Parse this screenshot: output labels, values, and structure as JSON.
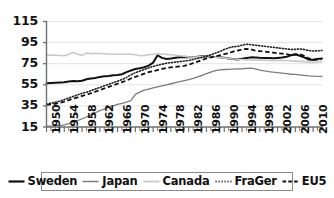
{
  "chart_data": {
    "type": "line",
    "title": "",
    "xlabel": "",
    "ylabel": "",
    "xlim": [
      1950,
      2012
    ],
    "ylim": [
      15,
      115
    ],
    "grid": true,
    "grid_axis": "y",
    "legend_position": "bottom",
    "yticks": [
      15,
      35,
      55,
      75,
      95,
      115
    ],
    "xticks": [
      1950,
      1954,
      1958,
      1962,
      1966,
      1970,
      1974,
      1978,
      1982,
      1986,
      1990,
      1994,
      1998,
      2002,
      2006,
      2010
    ],
    "x_minor_tick_interval": 1,
    "x": [
      1950,
      1951,
      1952,
      1953,
      1954,
      1955,
      1956,
      1957,
      1958,
      1959,
      1960,
      1961,
      1962,
      1963,
      1964,
      1965,
      1966,
      1967,
      1968,
      1969,
      1970,
      1971,
      1972,
      1973,
      1974,
      1975,
      1976,
      1977,
      1978,
      1979,
      1980,
      1981,
      1982,
      1983,
      1984,
      1985,
      1986,
      1987,
      1988,
      1989,
      1990,
      1991,
      1992,
      1993,
      1994,
      1995,
      1996,
      1997,
      1998,
      1999,
      2000,
      2001,
      2002,
      2003,
      2004,
      2005,
      2006,
      2007,
      2008,
      2009,
      2010,
      2011,
      2012
    ],
    "series": [
      {
        "name": "Sweden",
        "style": "solid",
        "color": "#111111",
        "width": 2.0,
        "values": [
          56.5,
          56.8,
          57.0,
          57.2,
          57.4,
          58.2,
          58.6,
          58.4,
          58.8,
          60.2,
          61.0,
          61.4,
          62.5,
          63.0,
          63.4,
          64.0,
          64.2,
          65.0,
          67.0,
          68.6,
          70.0,
          70.6,
          71.6,
          73.2,
          76.0,
          83.0,
          80.5,
          79.5,
          80.0,
          80.6,
          81.0,
          81.2,
          81.4,
          81.0,
          81.5,
          82.0,
          81.8,
          81.6,
          81.4,
          81.0,
          80.6,
          80.0,
          79.4,
          79.0,
          79.8,
          80.4,
          81.0,
          80.8,
          80.6,
          80.5,
          80.4,
          80.2,
          80.5,
          80.8,
          81.5,
          83.0,
          84.0,
          82.5,
          81.0,
          79.0,
          78.6,
          79.5,
          80.0
        ]
      },
      {
        "name": "Japan",
        "style": "solid",
        "color": "#7c7c7c",
        "width": 1.3,
        "values": [
          15.5,
          15.8,
          16.0,
          16.4,
          17.0,
          18.2,
          19.5,
          21.0,
          22.8,
          24.5,
          26.5,
          28.5,
          30.5,
          32.0,
          33.5,
          35.0,
          36.5,
          37.5,
          38.5,
          40.0,
          46.0,
          48.0,
          50.0,
          51.0,
          52.0,
          53.0,
          54.0,
          55.0,
          56.0,
          57.0,
          58.0,
          59.0,
          60.0,
          61.0,
          62.5,
          64.0,
          65.6,
          67.0,
          68.5,
          69.2,
          69.5,
          69.6,
          69.8,
          70.0,
          70.2,
          70.5,
          70.8,
          70.0,
          69.0,
          68.2,
          67.5,
          67.0,
          66.6,
          66.0,
          65.5,
          65.0,
          64.8,
          64.5,
          64.0,
          63.5,
          63.2,
          63.0,
          63.0
        ]
      },
      {
        "name": "Canada",
        "style": "solid",
        "color": "#c8c8c8",
        "width": 1.6,
        "values": [
          83.0,
          83.2,
          83.0,
          82.8,
          82.5,
          84.0,
          85.5,
          84.0,
          83.0,
          85.0,
          84.5,
          84.8,
          84.6,
          84.5,
          84.2,
          84.0,
          84.0,
          84.0,
          84.0,
          84.0,
          83.5,
          82.5,
          82.8,
          83.6,
          84.0,
          84.5,
          84.2,
          83.8,
          83.5,
          83.0,
          82.5,
          82.2,
          81.5,
          81.0,
          81.5,
          81.8,
          81.5,
          81.4,
          81.2,
          81.0,
          80.5,
          80.0,
          79.5,
          79.2,
          79.0,
          78.6,
          78.5,
          78.5,
          78.4,
          78.2,
          78.0,
          77.8,
          78.0,
          78.2,
          78.0,
          77.6,
          77.4,
          77.2,
          77.0,
          76.5,
          76.2,
          76.8,
          77.0
        ]
      },
      {
        "name": "FraGer",
        "style": "dotted",
        "color": "#222222",
        "width": 1.6,
        "values": [
          36.5,
          37.5,
          38.5,
          39.5,
          41.0,
          42.5,
          44.0,
          45.5,
          47.0,
          48.0,
          49.5,
          51.0,
          52.5,
          54.0,
          55.5,
          57.0,
          58.5,
          60.0,
          62.0,
          64.5,
          66.5,
          68.0,
          69.5,
          71.0,
          72.5,
          73.5,
          74.5,
          75.5,
          76.0,
          76.5,
          77.0,
          77.5,
          78.0,
          79.0,
          80.0,
          81.0,
          82.0,
          83.5,
          85.0,
          86.5,
          88.5,
          90.0,
          91.0,
          91.5,
          92.5,
          93.5,
          93.0,
          92.5,
          92.0,
          91.5,
          91.0,
          90.5,
          90.0,
          89.5,
          89.0,
          88.5,
          88.6,
          89.0,
          88.5,
          87.5,
          87.0,
          87.2,
          87.5
        ]
      },
      {
        "name": "EU5",
        "style": "dashed",
        "color": "#111111",
        "width": 1.8,
        "values": [
          36.0,
          36.5,
          37.0,
          38.0,
          39.0,
          40.5,
          42.0,
          43.0,
          44.5,
          45.5,
          47.0,
          48.5,
          50.0,
          51.5,
          53.0,
          54.5,
          56.0,
          57.5,
          59.0,
          61.0,
          62.5,
          64.0,
          65.5,
          67.0,
          68.0,
          69.0,
          70.0,
          71.0,
          71.5,
          72.0,
          72.5,
          73.0,
          74.0,
          75.5,
          77.0,
          78.5,
          80.0,
          81.0,
          82.0,
          83.0,
          84.0,
          85.0,
          86.5,
          87.5,
          88.5,
          89.0,
          88.5,
          87.5,
          87.0,
          86.5,
          86.0,
          85.5,
          85.0,
          84.5,
          84.0,
          83.0,
          83.5,
          84.0,
          82.5,
          80.0,
          79.0,
          79.0,
          79.5
        ]
      }
    ]
  },
  "axes": {
    "ytick_labels": [
      "115",
      "95",
      "75",
      "55",
      "35",
      "15"
    ],
    "xtick_labels": [
      "1950",
      "1954",
      "1958",
      "1962",
      "1966",
      "1970",
      "1974",
      "1978",
      "1982",
      "1986",
      "1990",
      "1994",
      "1998",
      "2002",
      "2006",
      "2010"
    ]
  },
  "legend": {
    "items": [
      {
        "label": "Sweden",
        "swatch": "solid-black-thick-icon"
      },
      {
        "label": "Japan",
        "swatch": "solid-gray-icon"
      },
      {
        "label": "Canada",
        "swatch": "solid-lightgray-icon"
      },
      {
        "label": "FraGer",
        "swatch": "dotted-black-icon"
      },
      {
        "label": "EU5",
        "swatch": "dashed-black-icon"
      }
    ]
  },
  "colors": {
    "sweden": "#111111",
    "japan": "#7c7c7c",
    "canada": "#c8c8c8",
    "frager": "#222222",
    "eu5": "#111111",
    "axis": "#6f6f6f",
    "grid": "#e3e3e3",
    "background": "#ffffff"
  }
}
